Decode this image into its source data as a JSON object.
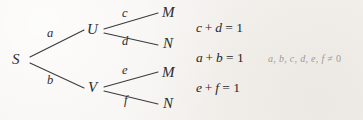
{
  "diagram": {
    "type": "probability-tree",
    "background_color": "#f6f4f1",
    "ink_color": "#2b2b2e",
    "note_color": "#9b9a98",
    "nodes": [
      {
        "id": "S",
        "label": "S",
        "x": 18,
        "y": 60
      },
      {
        "id": "U",
        "label": "U",
        "x": 92,
        "y": 30
      },
      {
        "id": "V",
        "label": "V",
        "x": 92,
        "y": 88
      },
      {
        "id": "M1",
        "label": "M",
        "x": 166,
        "y": 13
      },
      {
        "id": "N1",
        "label": "N",
        "x": 166,
        "y": 44
      },
      {
        "id": "M2",
        "label": "M",
        "x": 166,
        "y": 73
      },
      {
        "id": "N2",
        "label": "N",
        "x": 166,
        "y": 104
      }
    ],
    "edges": [
      {
        "id": "S-U",
        "from": "S",
        "to": "U",
        "label": "a",
        "label_x": 50,
        "label_y": 33
      },
      {
        "id": "S-V",
        "from": "S",
        "to": "V",
        "label": "b",
        "label_x": 50,
        "label_y": 81
      },
      {
        "id": "U-M1",
        "from": "U",
        "to": "M1",
        "label": "c",
        "label_x": 125,
        "label_y": 13
      },
      {
        "id": "U-N1",
        "from": "U",
        "to": "N1",
        "label": "d",
        "label_x": 125,
        "label_y": 42
      },
      {
        "id": "V-M2",
        "from": "V",
        "to": "M2",
        "label": "e",
        "label_x": 125,
        "label_y": 71
      },
      {
        "id": "V-N2",
        "from": "V",
        "to": "N2",
        "label": "f",
        "label_x": 126,
        "label_y": 101
      }
    ]
  },
  "equations": [
    {
      "id": "eq-cd",
      "text": "c + d = 1",
      "left_term1": "c",
      "operator": "+",
      "left_term2": "d",
      "equals": "=",
      "right": "1",
      "x": 196,
      "y": 28
    },
    {
      "id": "eq-ab",
      "text": "a + b = 1",
      "left_term1": "a",
      "operator": "+",
      "left_term2": "b",
      "equals": "=",
      "right": "1",
      "x": 196,
      "y": 58
    },
    {
      "id": "eq-ef",
      "text": "e + f = 1",
      "left_term1": "e",
      "operator": "+",
      "left_term2": "f",
      "equals": "=",
      "right": "1",
      "x": 196,
      "y": 88
    }
  ],
  "note": {
    "id": "nonzero-condition",
    "variables": "a, b, c, d, e, f",
    "relation": "≠",
    "value": "0",
    "text": "a, b, c, d, e, f ≠ 0",
    "x": 268,
    "y": 59
  }
}
